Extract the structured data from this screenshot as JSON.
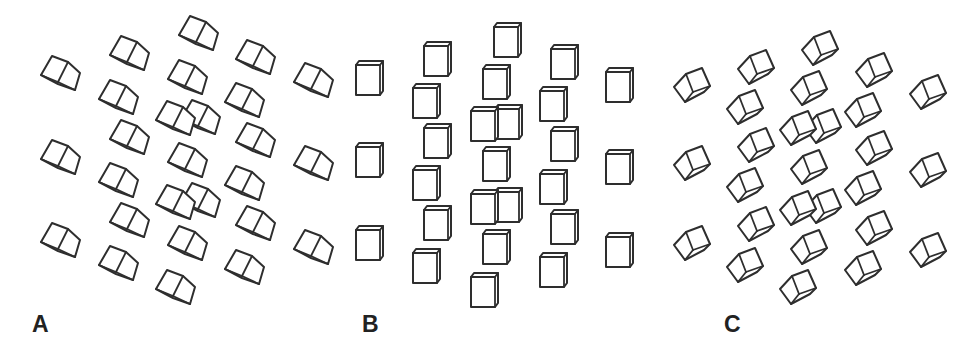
{
  "figure": {
    "background": "#ffffff",
    "stroke_color": "#2e2e2e",
    "panels": [
      {
        "id": "A",
        "label": "A",
        "label_pos": [
          32,
          313
        ],
        "cube_style": "rotated-bottom-view",
        "cubes": [
          [
            60,
            73
          ],
          [
            129,
            53
          ],
          [
            198,
            33
          ],
          [
            255,
            57
          ],
          [
            313,
            80
          ],
          [
            118,
            97
          ],
          [
            187,
            77
          ],
          [
            244,
            100
          ],
          [
            200,
            117
          ],
          [
            175,
            118
          ],
          [
            129,
            137
          ],
          [
            255,
            140
          ],
          [
            60,
            157
          ],
          [
            187,
            160
          ],
          [
            313,
            163
          ],
          [
            118,
            180
          ],
          [
            244,
            183
          ],
          [
            200,
            200
          ],
          [
            175,
            202
          ],
          [
            129,
            220
          ],
          [
            255,
            223
          ],
          [
            60,
            240
          ],
          [
            187,
            243
          ],
          [
            313,
            247
          ],
          [
            118,
            263
          ],
          [
            244,
            267
          ],
          [
            175,
            287
          ]
        ]
      },
      {
        "id": "B",
        "label": "B",
        "label_pos": [
          362,
          313
        ],
        "cube_style": "front-view",
        "cubes": [
          [
            369,
            79
          ],
          [
            437,
            60
          ],
          [
            507,
            41
          ],
          [
            564,
            63
          ],
          [
            619,
            86
          ],
          [
            426,
            102
          ],
          [
            496,
            83
          ],
          [
            553,
            105
          ],
          [
            508,
            123
          ],
          [
            484,
            125
          ],
          [
            437,
            142
          ],
          [
            564,
            145
          ],
          [
            369,
            161
          ],
          [
            496,
            165
          ],
          [
            619,
            168
          ],
          [
            426,
            184
          ],
          [
            553,
            188
          ],
          [
            508,
            206
          ],
          [
            484,
            208
          ],
          [
            437,
            224
          ],
          [
            564,
            228
          ],
          [
            369,
            244
          ],
          [
            496,
            248
          ],
          [
            619,
            251
          ],
          [
            426,
            267
          ],
          [
            553,
            271
          ],
          [
            484,
            291
          ]
        ]
      },
      {
        "id": "C",
        "label": "C",
        "label_pos": [
          724,
          313
        ],
        "cube_style": "rotated-top-view",
        "cubes": [
          [
            692,
            85
          ],
          [
            756,
            67
          ],
          [
            820,
            48
          ],
          [
            874,
            70
          ],
          [
            928,
            92
          ],
          [
            745,
            107
          ],
          [
            809,
            88
          ],
          [
            863,
            110
          ],
          [
            823,
            126
          ],
          [
            798,
            128
          ],
          [
            756,
            145
          ],
          [
            874,
            148
          ],
          [
            692,
            163
          ],
          [
            809,
            167
          ],
          [
            928,
            170
          ],
          [
            745,
            185
          ],
          [
            863,
            188
          ],
          [
            823,
            206
          ],
          [
            798,
            208
          ],
          [
            756,
            224
          ],
          [
            874,
            228
          ],
          [
            692,
            243
          ],
          [
            809,
            247
          ],
          [
            928,
            250
          ],
          [
            745,
            265
          ],
          [
            863,
            268
          ],
          [
            798,
            287
          ]
        ]
      }
    ]
  }
}
